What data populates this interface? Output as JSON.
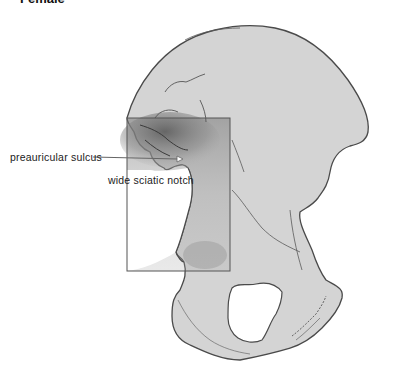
{
  "figure": {
    "title": "Female",
    "colors": {
      "bone_fill": "#d4d4d4",
      "bone_outline": "#4a4a4a",
      "shading": "#6e6e6e",
      "highlight_box": "#555555",
      "background": "#ffffff"
    }
  },
  "labels": {
    "preauricular_sulcus": "preauricular sulcus",
    "wide_sciatic_notch": "wide sciatic notch"
  },
  "annotation": {
    "highlight_box": {
      "x": 127,
      "y": 118,
      "width": 103,
      "height": 153
    },
    "sulcus_arrow": {
      "x1": 93,
      "y1": 157,
      "x2": 182,
      "y2": 159
    }
  }
}
